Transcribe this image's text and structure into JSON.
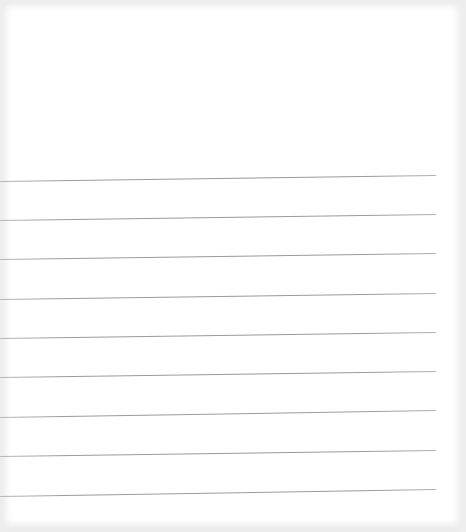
{
  "page": {
    "type": "lined-paper",
    "background_color": "#ffffff",
    "line_color": "#9a9a9a",
    "line_count": 9,
    "line_start_x": 0,
    "line_end_x": 436,
    "lines": [
      {
        "y_left": 181,
        "y_right": 175
      },
      {
        "y_left": 220,
        "y_right": 214
      },
      {
        "y_left": 259,
        "y_right": 253
      },
      {
        "y_left": 299,
        "y_right": 293
      },
      {
        "y_left": 338,
        "y_right": 332
      },
      {
        "y_left": 377,
        "y_right": 371
      },
      {
        "y_left": 417,
        "y_right": 410
      },
      {
        "y_left": 456,
        "y_right": 450
      },
      {
        "y_left": 496,
        "y_right": 489
      }
    ]
  }
}
